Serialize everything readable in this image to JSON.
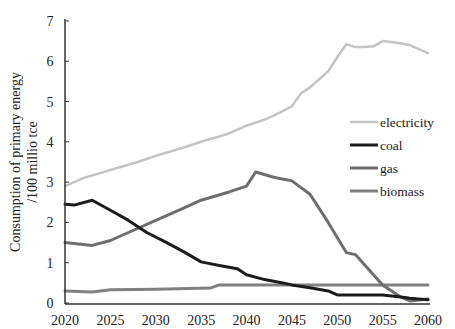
{
  "chart_data": {
    "type": "line",
    "title": "",
    "xlabel": "",
    "ylabel": "Consumption of primary energy /100 millio tce",
    "ylabel_lines": [
      "Consumption of primary energy",
      "/100 millio tce"
    ],
    "xlim": [
      2020,
      2060
    ],
    "ylim": [
      0,
      7
    ],
    "x_ticks": [
      2020,
      2025,
      2030,
      2035,
      2040,
      2045,
      2050,
      2055,
      2060
    ],
    "y_ticks": [
      0,
      1,
      2,
      3,
      4,
      5,
      6,
      7
    ],
    "grid": false,
    "legend_position": "right",
    "series": [
      {
        "name": "electricity",
        "color": "#c4c4c4",
        "width": 2.5,
        "x": [
          2020,
          2022,
          2025,
          2028,
          2030,
          2033,
          2035,
          2038,
          2040,
          2042,
          2043,
          2045,
          2046,
          2047,
          2049,
          2050,
          2051,
          2052,
          2053,
          2054,
          2055,
          2056,
          2058,
          2059,
          2060
        ],
        "values": [
          2.9,
          3.1,
          3.3,
          3.5,
          3.65,
          3.85,
          4.0,
          4.2,
          4.4,
          4.55,
          4.65,
          4.88,
          5.2,
          5.35,
          5.75,
          6.1,
          6.42,
          6.35,
          6.35,
          6.37,
          6.5,
          6.48,
          6.4,
          6.3,
          6.2
        ]
      },
      {
        "name": "coal",
        "color": "#1c1c1c",
        "width": 3,
        "x": [
          2020,
          2021,
          2023,
          2025,
          2027,
          2029,
          2031,
          2033,
          2035,
          2037,
          2039,
          2040,
          2042,
          2044,
          2045,
          2047,
          2049,
          2050,
          2052,
          2055,
          2057,
          2058,
          2060
        ],
        "values": [
          2.45,
          2.43,
          2.55,
          2.3,
          2.05,
          1.75,
          1.52,
          1.28,
          1.02,
          0.93,
          0.85,
          0.7,
          0.58,
          0.5,
          0.45,
          0.38,
          0.3,
          0.2,
          0.2,
          0.2,
          0.15,
          0.12,
          0.08
        ]
      },
      {
        "name": "gas",
        "color": "#6e6e6e",
        "width": 3,
        "x": [
          2020,
          2023,
          2025,
          2027,
          2030,
          2033,
          2035,
          2038,
          2040,
          2041,
          2043,
          2045,
          2047,
          2049,
          2051,
          2052,
          2053,
          2055,
          2057,
          2058,
          2060
        ],
        "values": [
          1.5,
          1.43,
          1.55,
          1.75,
          2.05,
          2.35,
          2.55,
          2.75,
          2.9,
          3.25,
          3.12,
          3.03,
          2.7,
          2.0,
          1.25,
          1.2,
          0.95,
          0.45,
          0.15,
          0.05,
          0.1
        ]
      },
      {
        "name": "biomass",
        "color": "#808080",
        "width": 3,
        "x": [
          2020,
          2023,
          2025,
          2030,
          2036,
          2037,
          2040,
          2045,
          2050,
          2055,
          2060
        ],
        "values": [
          0.3,
          0.27,
          0.33,
          0.34,
          0.37,
          0.45,
          0.45,
          0.45,
          0.45,
          0.45,
          0.45
        ]
      }
    ]
  }
}
